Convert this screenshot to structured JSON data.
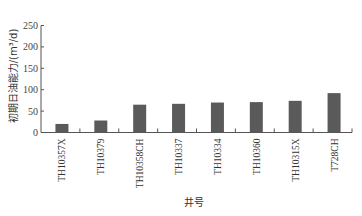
{
  "chart_data": {
    "type": "bar",
    "title": "",
    "xlabel": "井号",
    "ylabel": "初期日油能力/(m³/d)",
    "categories": [
      "TH10357X",
      "TH10379",
      "TH10358CH",
      "TH10337",
      "TH10334",
      "TH10360",
      "TH10315X",
      "T728CH"
    ],
    "values": [
      20,
      28,
      65,
      67,
      70,
      71,
      74,
      92
    ],
    "ylim": [
      0,
      250
    ],
    "yticks": [
      0,
      50,
      100,
      150,
      200,
      250
    ],
    "grid": false,
    "legend": null,
    "bar_color": "#5a5a5a"
  }
}
